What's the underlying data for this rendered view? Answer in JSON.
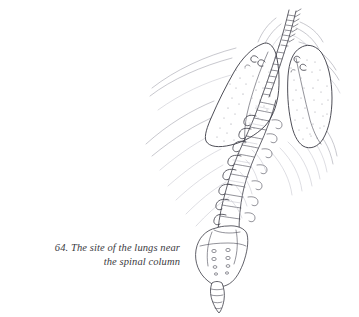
{
  "figure": {
    "number": "64.",
    "caption_line_1": "64. The site of the lungs near",
    "caption_line_2": "the spinal column",
    "caption_full": "64. The site of the lungs near the spinal column",
    "title": "The site of the lungs near the spinal column",
    "medium": "pen and ink line drawing",
    "background_color": "#ffffff",
    "ink_color": "#3a3a44",
    "soft_ink_color": "#9a9aa6",
    "faint_ink_color": "#bcbcc6",
    "caption_color": "#3b3b42"
  },
  "diagram": {
    "type": "anatomical-illustration",
    "view": "posterior oblique",
    "parts": [
      {
        "name": "left-lung",
        "label": "left lung",
        "side": "left",
        "texture": "stippled"
      },
      {
        "name": "right-lung",
        "label": "right lung",
        "side": "right",
        "texture": "stippled"
      },
      {
        "name": "vertebral-column",
        "label": "vertebral column",
        "segments": "cervical, thoracic, lumbar"
      },
      {
        "name": "sacrum",
        "label": "sacrum",
        "features": "sacral foramina"
      },
      {
        "name": "coccyx",
        "label": "coccyx",
        "features": "tapering segmented tip"
      },
      {
        "name": "ribs",
        "label": "ribs",
        "features": "fanning costal contours"
      },
      {
        "name": "transverse-processes",
        "label": "transverse processes"
      },
      {
        "name": "body-contour",
        "label": "soft tissue contour lines"
      }
    ],
    "vertebra_count": 17,
    "sacral_foramina_count": 8,
    "coccyx_segments": 4
  }
}
